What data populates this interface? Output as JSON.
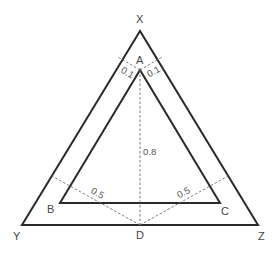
{
  "diagram": {
    "type": "nested-triangles",
    "outer_triangle": {
      "vertices": {
        "X": {
          "label": "X",
          "x": 140,
          "y": 31
        },
        "Y": {
          "label": "Y",
          "x": 22,
          "y": 225
        },
        "Z": {
          "label": "Z",
          "x": 258,
          "y": 225
        }
      }
    },
    "inner_triangle": {
      "vertices": {
        "A": {
          "label": "A",
          "x": 140,
          "y": 70
        },
        "B": {
          "label": "B",
          "x": 60,
          "y": 203
        },
        "C": {
          "label": "C",
          "x": 220,
          "y": 203
        }
      }
    },
    "point_D": {
      "label": "D",
      "x": 140,
      "y": 225
    },
    "measurements": {
      "a_left_dist": "0.1",
      "a_right_dist": "0.1",
      "ad_height": "0.8",
      "d_left_dist": "0.5",
      "d_right_dist": "0.5"
    },
    "colors": {
      "line": "#2a2a2a",
      "dash": "#6a6a6a",
      "text": "#444444"
    }
  }
}
